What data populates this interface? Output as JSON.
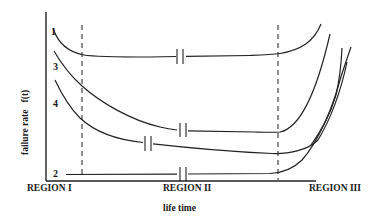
{
  "diagram": {
    "y_axis_label": "failure rate   f(t)",
    "x_axis_label": "life time",
    "regions": [
      {
        "label": "REGION I"
      },
      {
        "label": "REGION II"
      },
      {
        "label": "REGION III"
      }
    ],
    "curves": [
      {
        "id": "1",
        "label": "1",
        "description": "high early failure, flat useful life, wear-out rise"
      },
      {
        "id": "2",
        "label": "2",
        "description": "flat low failure rate, late wear-out rise"
      },
      {
        "id": "3",
        "label": "3",
        "description": "decreasing failure rate, then wear-out rise"
      },
      {
        "id": "4",
        "label": "4",
        "description": "decreasing failure rate, then wear-out rise"
      }
    ],
    "boundaries": [
      {
        "name": "region-I-II-boundary",
        "style": "dashed"
      },
      {
        "name": "region-II-III-boundary",
        "style": "dashed"
      }
    ],
    "break_marks": "double vertical ticks on each curve in Region II indicating time-axis break",
    "colors": {
      "line": "#222222",
      "background": "#ffffff"
    }
  }
}
